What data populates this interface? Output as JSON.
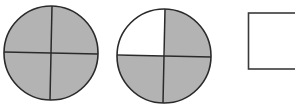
{
  "diagram": {
    "shade_color": "#b3b3b3",
    "stroke_color": "#2a2a2a",
    "background": "#ffffff",
    "figures": [
      {
        "type": "circle",
        "parts": 4,
        "shaded_parts": 4,
        "quadrants": {
          "top_left": true,
          "top_right": true,
          "bottom_left": true,
          "bottom_right": true
        }
      },
      {
        "type": "circle",
        "parts": 4,
        "shaded_parts": 3,
        "quadrants": {
          "top_left": false,
          "top_right": true,
          "bottom_left": true,
          "bottom_right": true
        }
      },
      {
        "type": "answer-box",
        "content": ""
      }
    ]
  }
}
